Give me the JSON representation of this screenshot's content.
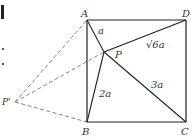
{
  "diagram": {
    "type": "geometry-square-with-rotation",
    "points": {
      "A": {
        "label": "A",
        "x": 87,
        "y": 20
      },
      "B": {
        "label": "B",
        "x": 87,
        "y": 122
      },
      "C": {
        "label": "C",
        "x": 186,
        "y": 122
      },
      "D": {
        "label": "D",
        "x": 186,
        "y": 20
      },
      "P": {
        "label": "P",
        "x": 104,
        "y": 52
      },
      "P_prime": {
        "label": "P'",
        "x": 15,
        "y": 102
      }
    },
    "segment_labels": {
      "PA": "a",
      "PB": "2a",
      "PC": "3a",
      "PD": "√6a"
    },
    "solid_segments": [
      "AB",
      "BC",
      "CD",
      "DA",
      "PA",
      "PB",
      "PC",
      "PD"
    ],
    "dashed_segments": [
      "P'A",
      "P'B",
      "P'P"
    ],
    "colors": {
      "line": "#222222",
      "dashed": "#666666",
      "text": "#333333"
    }
  }
}
